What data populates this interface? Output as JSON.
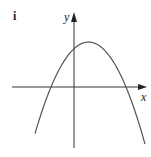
{
  "chart_data": {
    "type": "line",
    "title": "",
    "panel_label": "i",
    "xlabel": "x",
    "ylabel": "y",
    "grid": false,
    "legend": "none",
    "series": [
      {
        "name": "parabola",
        "shape": "downward-opening parabola",
        "roots": [
          -23,
          52
        ],
        "vertex": [
          14.5,
          45
        ],
        "y_intercept": 38,
        "x_range": [
          -39,
          71
        ]
      }
    ],
    "xlim": [
      -62,
      73
    ],
    "ylim": [
      -61,
      75
    ]
  },
  "colors": {
    "curve": "#555555",
    "axis": "#333333"
  }
}
